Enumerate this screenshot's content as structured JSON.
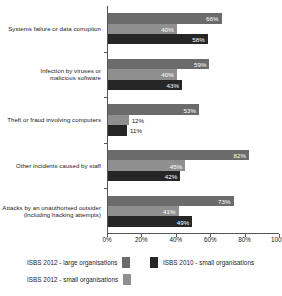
{
  "chart_data": {
    "type": "bar",
    "orientation": "horizontal",
    "title": "",
    "xlabel": "",
    "ylabel": "",
    "xlim": [
      0,
      100
    ],
    "xticks": [
      "0%",
      "20%",
      "40%",
      "60%",
      "80%",
      "100%"
    ],
    "grid": false,
    "legend_position": "bottom",
    "categories": [
      "Systems failure or data corruption",
      "Infection by viruses or malicious software",
      "Theft or fraud involving computers",
      "Other incidents caused by staff",
      "Attacks by an unauthorised outsider (including hacking attempts)"
    ],
    "category_lines": [
      [
        "Systems failure or data corruption"
      ],
      [
        "Infection by viruses or",
        "malicious software"
      ],
      [
        "Theft or fraud involving computers"
      ],
      [
        "Other incidents caused by staff"
      ],
      [
        "Attacks by an unauthorised outsider",
        "(including hacking attempts)"
      ]
    ],
    "series": [
      {
        "name": "ISBS 2012 - large organisations",
        "color": "#6b6b6b",
        "values": [
          66,
          59,
          53,
          82,
          73
        ],
        "labels": [
          "66%",
          "59%",
          "53%",
          "82%",
          "73%"
        ]
      },
      {
        "name": "ISBS 2012 - small organisations",
        "color": "#8f8f8f",
        "values": [
          40,
          40,
          12,
          45,
          41
        ],
        "labels": [
          "40%",
          "40%",
          "12%",
          "45%",
          "41%"
        ]
      },
      {
        "name": "ISBS 2010 - small organisations",
        "color": "#262626",
        "values": [
          58,
          43,
          11,
          42,
          49
        ],
        "labels": [
          "58%",
          "43%",
          "11%",
          "42%",
          "49%"
        ]
      }
    ],
    "legend": [
      {
        "label": "ISBS 2012 - large organisations",
        "color": "#6b6b6b"
      },
      {
        "label": "ISBS 2010 - small organisations",
        "color": "#262626"
      },
      {
        "label": "ISBS 2012 - small organisations",
        "color": "#8f8f8f"
      }
    ]
  }
}
